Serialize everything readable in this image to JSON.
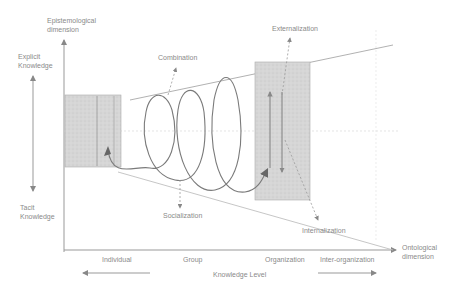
{
  "diagram": {
    "y_axis": {
      "label_line1": "Epistemological",
      "label_line2": "dimension",
      "top_label_line1": "Explicit",
      "top_label_line2": "Knowledge",
      "bottom_label_line1": "Tacit",
      "bottom_label_line2": "Knowledge"
    },
    "x_axis": {
      "label_line1": "Ontological",
      "label_line2": "dimension",
      "levels": [
        "Individual",
        "Group",
        "Organization",
        "Inter-organization"
      ],
      "caption": "Knowledge Level"
    },
    "modes": {
      "combination": "Combination",
      "externalization": "Externalization",
      "socialization": "Socialization",
      "internalization": "Internalization"
    },
    "colors": {
      "line": "#8a8a8a",
      "box_fill": "#d9d9d9",
      "text": "#8a8a8a",
      "spiral": "#7a7a7a"
    }
  }
}
